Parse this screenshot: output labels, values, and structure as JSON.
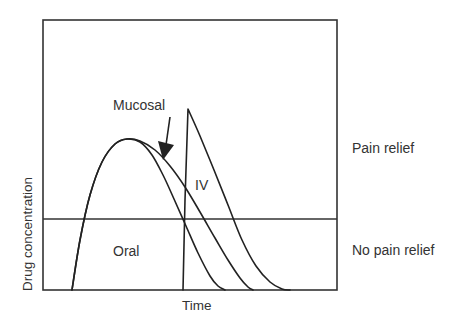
{
  "chart_data": {
    "type": "line",
    "title": "",
    "xlabel": "Time",
    "ylabel": "Drug concentration",
    "grid": false,
    "legend_position": "none (inline labels)",
    "plot_area_px": {
      "left": 43,
      "top": 20,
      "right": 337,
      "bottom": 290
    },
    "threshold": {
      "y_px": 219,
      "label_above": "Pain relief",
      "label_below": "No pain relief"
    },
    "series": [
      {
        "name": "Oral",
        "label": "Oral",
        "points_px": [
          [
            72,
            290
          ],
          [
            80,
            240
          ],
          [
            90,
            195
          ],
          [
            102,
            162
          ],
          [
            115,
            144
          ],
          [
            127,
            139
          ],
          [
            140,
            142
          ],
          [
            152,
            155
          ],
          [
            163,
            175
          ],
          [
            174,
            199
          ],
          [
            186,
            226
          ],
          [
            198,
            253
          ],
          [
            210,
            276
          ],
          [
            218,
            286
          ],
          [
            225,
            290
          ]
        ]
      },
      {
        "name": "Mucosal",
        "label": "Mucosal",
        "points_px": [
          [
            72,
            290
          ],
          [
            80,
            240
          ],
          [
            90,
            195
          ],
          [
            102,
            162
          ],
          [
            115,
            144
          ],
          [
            127,
            139
          ],
          [
            140,
            141
          ],
          [
            155,
            150
          ],
          [
            170,
            166
          ],
          [
            185,
            187
          ],
          [
            200,
            212
          ],
          [
            215,
            238
          ],
          [
            228,
            260
          ],
          [
            240,
            278
          ],
          [
            248,
            287
          ],
          [
            253,
            290
          ]
        ]
      },
      {
        "name": "IV",
        "label": "IV",
        "points_px": [
          [
            183,
            290
          ],
          [
            185,
            200
          ],
          [
            188,
            109
          ],
          [
            200,
            136
          ],
          [
            214,
            170
          ],
          [
            228,
            205
          ],
          [
            242,
            240
          ],
          [
            256,
            266
          ],
          [
            270,
            282
          ],
          [
            282,
            289
          ],
          [
            290,
            290
          ]
        ]
      }
    ],
    "annotations": [
      {
        "text": "Mucosal",
        "x_px": 113,
        "y_px": 110,
        "arrow_from_px": [
          170,
          117
        ],
        "arrow_to_px": [
          163,
          158
        ]
      },
      {
        "text": "IV",
        "x_px": 195,
        "y_px": 190
      },
      {
        "text": "Oral",
        "x_px": 113,
        "y_px": 256
      },
      {
        "text": "Pain relief",
        "x_px": 352,
        "y_px": 153
      },
      {
        "text": "No pain relief",
        "x_px": 352,
        "y_px": 255
      }
    ]
  },
  "labels": {
    "ylabel": "Drug concentration",
    "xlabel": "Time",
    "mucosal": "Mucosal",
    "iv": "IV",
    "oral": "Oral",
    "pain_relief": "Pain relief",
    "no_pain_relief": "No pain relief"
  }
}
